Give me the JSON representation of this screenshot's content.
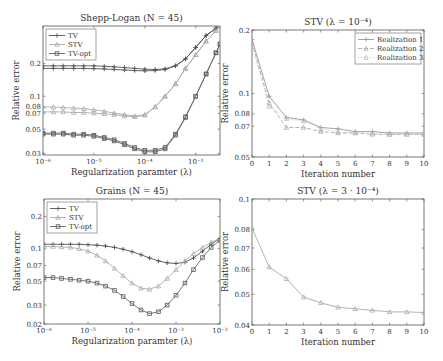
{
  "chart_data": [
    {
      "id": "tl",
      "type": "line",
      "title": "Shepp-Logan (N = 45)",
      "xlabel": "Regularization paramter (λ)",
      "ylabel": "Relative error",
      "xscale": "log",
      "yscale": "log",
      "xlim": [
        1e-06,
        0.003
      ],
      "ylim": [
        0.029,
        0.44
      ],
      "xticks": [
        {
          "v": 1e-06,
          "label": "10⁻⁶"
        },
        {
          "v": 1e-05,
          "label": "10⁻⁵"
        },
        {
          "v": 0.0001,
          "label": "10⁻⁴"
        },
        {
          "v": 0.001,
          "label": "10⁻³"
        }
      ],
      "yticks": [
        {
          "v": 0.03,
          "label": "0.03"
        },
        {
          "v": 0.05,
          "label": "0.05"
        },
        {
          "v": 0.07,
          "label": "0.07"
        },
        {
          "v": 0.08,
          "label": "0.08"
        },
        {
          "v": 0.1,
          "label": "0.1"
        },
        {
          "v": 0.2,
          "label": "0.2"
        }
      ],
      "legend": "upper-left",
      "box": [
        43,
        26,
        220,
        155
      ],
      "x": [
        1e-06,
        1.6e-06,
        2.5e-06,
        4e-06,
        6.3e-06,
        1e-05,
        1.6e-05,
        2.5e-05,
        4e-05,
        6.3e-05,
        0.0001,
        0.00016,
        0.00025,
        0.0004,
        0.00063,
        0.001,
        0.0016,
        0.0025,
        0.003
      ],
      "series": [
        {
          "name": "TV",
          "color": "#555555",
          "marker": "plus",
          "dash": "",
          "values": [
            0.19,
            0.19,
            0.19,
            0.19,
            0.19,
            0.19,
            0.188,
            0.186,
            0.183,
            0.18,
            0.177,
            0.176,
            0.178,
            0.19,
            0.22,
            0.28,
            0.36,
            0.42,
            0.44
          ]
        },
        {
          "name": "STV",
          "color": "#aaaaaa",
          "marker": "triangle",
          "dash": "",
          "values": [
            0.08,
            0.08,
            0.079,
            0.078,
            0.077,
            0.075,
            0.073,
            0.07,
            0.068,
            0.066,
            0.068,
            0.08,
            0.1,
            0.13,
            0.18,
            0.24,
            0.32,
            0.4,
            0.44
          ]
        },
        {
          "name": "TV-opt",
          "color": "#666666",
          "marker": "square",
          "dash": "",
          "values": [
            0.046,
            0.046,
            0.046,
            0.045,
            0.045,
            0.044,
            0.042,
            0.04,
            0.037,
            0.034,
            0.032,
            0.032,
            0.034,
            0.045,
            0.065,
            0.1,
            0.16,
            0.25,
            0.3
          ]
        },
        {
          "name": "TV (2)",
          "color": "#555555",
          "marker": "plus",
          "dash": "",
          "values": [
            0.18,
            0.18,
            0.18,
            0.18,
            0.18,
            0.179,
            0.178,
            0.176,
            0.174,
            0.172,
            0.171,
            0.172,
            0.176,
            0.19,
            0.22,
            0.28,
            0.36,
            0.42,
            0.44
          ],
          "hide_legend": true
        },
        {
          "name": "STV (2)",
          "color": "#aaaaaa",
          "marker": "triangle",
          "dash": "",
          "values": [
            0.072,
            0.072,
            0.072,
            0.071,
            0.071,
            0.07,
            0.069,
            0.068,
            0.066,
            0.065,
            0.067,
            0.08,
            0.1,
            0.13,
            0.18,
            0.24,
            0.32,
            0.4,
            0.44
          ],
          "hide_legend": true
        },
        {
          "name": "TV-opt (2)",
          "color": "#666666",
          "marker": "square",
          "dash": "",
          "values": [
            0.045,
            0.045,
            0.045,
            0.044,
            0.044,
            0.043,
            0.041,
            0.039,
            0.036,
            0.033,
            0.031,
            0.031,
            0.033,
            0.044,
            0.064,
            0.1,
            0.16,
            0.25,
            0.3
          ],
          "hide_legend": true
        }
      ]
    },
    {
      "id": "tr",
      "type": "line",
      "title": "STV (λ = 10⁻⁴)",
      "xlabel": "Iteration number",
      "ylabel": "Relative error",
      "xscale": "linear",
      "yscale": "log",
      "xlim": [
        0,
        10
      ],
      "ylim": [
        0.05,
        0.2
      ],
      "xticks": [
        {
          "v": 0,
          "label": "0"
        },
        {
          "v": 1,
          "label": "1"
        },
        {
          "v": 2,
          "label": "2"
        },
        {
          "v": 3,
          "label": "3"
        },
        {
          "v": 4,
          "label": "4"
        },
        {
          "v": 5,
          "label": "5"
        },
        {
          "v": 6,
          "label": "6"
        },
        {
          "v": 7,
          "label": "7"
        },
        {
          "v": 8,
          "label": "8"
        },
        {
          "v": 9,
          "label": "9"
        },
        {
          "v": 10,
          "label": "10"
        }
      ],
      "yticks": [
        {
          "v": 0.05,
          "label": "0.05"
        },
        {
          "v": 0.07,
          "label": "0.07"
        },
        {
          "v": 0.08,
          "label": "0.08"
        },
        {
          "v": 0.1,
          "label": "0.1"
        },
        {
          "v": 0.2,
          "label": "0.2"
        }
      ],
      "legend": "upper-right",
      "box": [
        252,
        30,
        424,
        157
      ],
      "x": [
        0,
        1,
        2,
        3,
        4,
        5,
        6,
        7,
        8,
        9,
        10
      ],
      "series": [
        {
          "name": "Realization 1",
          "color": "#999999",
          "marker": "plus",
          "dash": "",
          "values": [
            0.18,
            0.097,
            0.077,
            0.075,
            0.069,
            0.068,
            0.066,
            0.066,
            0.065,
            0.065,
            0.065
          ]
        },
        {
          "name": "Realization 2",
          "color": "#aaaaaa",
          "marker": "triangle",
          "dash": "4,2",
          "values": [
            0.175,
            0.09,
            0.069,
            0.069,
            0.066,
            0.065,
            0.065,
            0.064,
            0.064,
            0.064,
            0.064
          ]
        },
        {
          "name": "Realization 3",
          "color": "#bbbbbb",
          "marker": "triangle",
          "dash": "1,2",
          "values": [
            0.17,
            0.087,
            0.076,
            0.074,
            0.068,
            0.066,
            0.065,
            0.065,
            0.064,
            0.064,
            0.064
          ]
        }
      ]
    },
    {
      "id": "bl",
      "type": "line",
      "title": "Grains (N = 45)",
      "xlabel": "Regularization paramter (λ)",
      "ylabel": "Relative error",
      "xscale": "log",
      "yscale": "log",
      "xlim": [
        1e-06,
        0.01
      ],
      "ylim": [
        0.02,
        0.29
      ],
      "xticks": [
        {
          "v": 1e-06,
          "label": "10⁻⁶"
        },
        {
          "v": 1e-05,
          "label": "10⁻⁵"
        },
        {
          "v": 0.0001,
          "label": "10⁻⁴"
        },
        {
          "v": 0.001,
          "label": "10⁻³"
        },
        {
          "v": 0.01,
          "label": "10⁻²"
        }
      ],
      "yticks": [
        {
          "v": 0.02,
          "label": "0.02"
        },
        {
          "v": 0.03,
          "label": "0.03"
        },
        {
          "v": 0.05,
          "label": "0.05"
        },
        {
          "v": 0.07,
          "label": "0.07"
        },
        {
          "v": 0.1,
          "label": "0.1"
        },
        {
          "v": 0.2,
          "label": "0.2"
        }
      ],
      "legend": "upper-left",
      "box": [
        44,
        199,
        220,
        324
      ],
      "x": [
        1e-06,
        1.6e-06,
        2.5e-06,
        4e-06,
        6.3e-06,
        1e-05,
        1.6e-05,
        2.5e-05,
        4e-05,
        6.3e-05,
        0.0001,
        0.00016,
        0.00025,
        0.0004,
        0.00063,
        0.001,
        0.0016,
        0.0025,
        0.004,
        0.0063,
        0.01
      ],
      "series": [
        {
          "name": "TV",
          "color": "#555555",
          "marker": "plus",
          "dash": "",
          "values": [
            0.11,
            0.11,
            0.11,
            0.11,
            0.11,
            0.109,
            0.108,
            0.106,
            0.103,
            0.099,
            0.094,
            0.088,
            0.082,
            0.077,
            0.074,
            0.073,
            0.075,
            0.082,
            0.095,
            0.11,
            0.125
          ]
        },
        {
          "name": "STV",
          "color": "#aaaaaa",
          "marker": "triangle",
          "dash": "",
          "values": [
            0.105,
            0.105,
            0.104,
            0.103,
            0.1,
            0.095,
            0.087,
            0.077,
            0.066,
            0.056,
            0.048,
            0.043,
            0.042,
            0.045,
            0.053,
            0.064,
            0.077,
            0.09,
            0.103,
            0.115,
            0.125
          ]
        },
        {
          "name": "TV-opt",
          "color": "#666666",
          "marker": "square",
          "dash": "",
          "values": [
            0.054,
            0.054,
            0.053,
            0.052,
            0.051,
            0.05,
            0.048,
            0.045,
            0.041,
            0.036,
            0.031,
            0.027,
            0.025,
            0.026,
            0.03,
            0.037,
            0.048,
            0.064,
            0.083,
            0.103,
            0.12
          ]
        }
      ]
    },
    {
      "id": "br",
      "type": "line",
      "title": "STV (λ = 3 · 10⁻⁴)",
      "xlabel": "Iteration number",
      "ylabel": "Relative error",
      "xscale": "linear",
      "yscale": "log",
      "xlim": [
        0,
        10
      ],
      "ylim": [
        0.04,
        0.1
      ],
      "xticks": [
        {
          "v": 0,
          "label": "0"
        },
        {
          "v": 1,
          "label": "1"
        },
        {
          "v": 2,
          "label": "2"
        },
        {
          "v": 3,
          "label": "3"
        },
        {
          "v": 4,
          "label": "4"
        },
        {
          "v": 5,
          "label": "5"
        },
        {
          "v": 6,
          "label": "6"
        },
        {
          "v": 7,
          "label": "7"
        },
        {
          "v": 8,
          "label": "8"
        },
        {
          "v": 9,
          "label": "9"
        },
        {
          "v": 10,
          "label": "10"
        }
      ],
      "yticks": [
        {
          "v": 0.04,
          "label": "0.04"
        },
        {
          "v": 0.05,
          "label": "0.05"
        },
        {
          "v": 0.06,
          "label": "0.06"
        },
        {
          "v": 0.07,
          "label": "0.07"
        },
        {
          "v": 0.08,
          "label": "0.08"
        },
        {
          "v": 0.1,
          "label": "0.1"
        }
      ],
      "legend": "none",
      "box": [
        252,
        199,
        424,
        325
      ],
      "x": [
        0,
        1,
        2,
        3,
        4,
        5,
        6,
        7,
        8,
        9,
        10
      ],
      "series": [
        {
          "name": "STV",
          "color": "#aaaaaa",
          "marker": "triangle",
          "dash": "",
          "values": [
            0.081,
            0.061,
            0.056,
            0.049,
            0.047,
            0.0455,
            0.045,
            0.0445,
            0.044,
            0.044,
            0.0438
          ]
        }
      ]
    }
  ]
}
